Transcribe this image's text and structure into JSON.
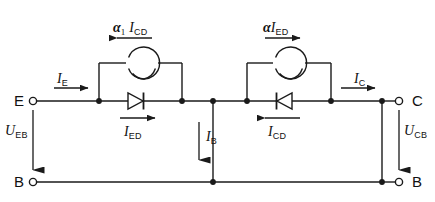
{
  "diagram": {
    "type": "electrical-schematic",
    "line_color": "#1a1a1a",
    "background_color": "#ffffff",
    "terminals": [
      {
        "id": "emitter",
        "label": "E",
        "position": "top-left"
      },
      {
        "id": "base-left",
        "label": "B",
        "position": "bottom-left"
      },
      {
        "id": "collector",
        "label": "C",
        "position": "top-right"
      },
      {
        "id": "base-right",
        "label": "B",
        "position": "bottom-right"
      }
    ],
    "sources": [
      {
        "id": "left-current-source",
        "symbol": "circle",
        "label_alpha": "α",
        "label_alpha_sub": "1",
        "label_current": "I",
        "label_current_sub": "CD",
        "arrow_direction": "left"
      },
      {
        "id": "right-current-source",
        "symbol": "circle",
        "label_alpha": "α",
        "label_alpha_sub": "",
        "label_current": "I",
        "label_current_sub": "ED",
        "arrow_direction": "right"
      }
    ],
    "diodes": [
      {
        "id": "emitter-diode",
        "orientation": "right",
        "label_current": "I",
        "label_current_sub": "ED",
        "arrow_direction": "right"
      },
      {
        "id": "collector-diode",
        "orientation": "left",
        "label_current": "I",
        "label_current_sub": "CD",
        "arrow_direction": "left"
      }
    ],
    "currents": [
      {
        "id": "emitter-current",
        "symbol": "I",
        "subscript": "E",
        "arrow_direction": "right"
      },
      {
        "id": "collector-current",
        "symbol": "I",
        "subscript": "C",
        "arrow_direction": "right"
      },
      {
        "id": "base-current",
        "symbol": "I",
        "subscript": "B",
        "arrow_direction": "down"
      }
    ],
    "voltages": [
      {
        "id": "emitter-base-voltage",
        "symbol": "U",
        "subscript": "EB",
        "arrow_direction": "down"
      },
      {
        "id": "collector-base-voltage",
        "symbol": "U",
        "subscript": "CB",
        "arrow_direction": "down"
      }
    ]
  }
}
